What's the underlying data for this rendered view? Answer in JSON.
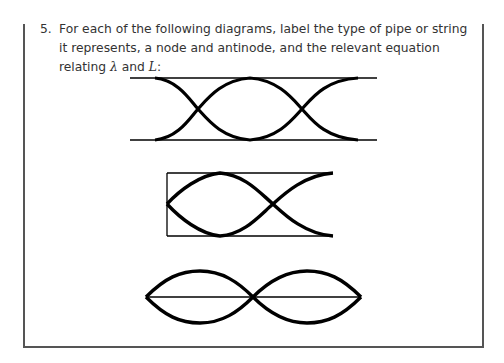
{
  "question": {
    "number": "5.",
    "text_part1": "For each of the following diagrams, label the type of pipe or string it represents, a node and antinode, and the relevant equation relating ",
    "symbol_lambda": "λ",
    "text_and": " and ",
    "symbol_L": "L",
    "text_end": ":"
  },
  "diagrams": [
    {
      "id": 1,
      "description": "Open-open pipe: two horizontal lines with standing wave envelope, two nodes"
    },
    {
      "id": 2,
      "description": "Closed-open pipe: box closed at left, open at right, standing wave envelope"
    },
    {
      "id": 3,
      "description": "String fixed at both ends: two loops, one node in middle"
    }
  ],
  "colors": {
    "line": "#000000",
    "frame": "#555555",
    "text": "#333333"
  }
}
